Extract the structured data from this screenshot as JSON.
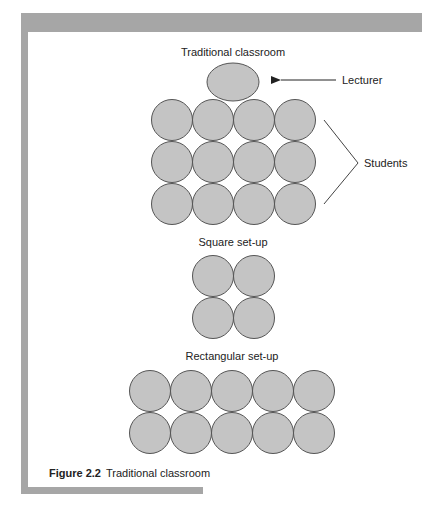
{
  "figure": {
    "caption_number": "Figure 2.2",
    "caption_text": "Traditional classroom",
    "colors": {
      "frame": "#a6a6a6",
      "circle_fill": "#c4c4c4",
      "circle_stroke": "#555555"
    }
  },
  "sections": [
    {
      "title": "Traditional classroom",
      "layout": "lecturer ellipse above 3 rows x 4 columns of students"
    },
    {
      "title": "Square set-up",
      "layout": "2 rows x 2 columns"
    },
    {
      "title": "Rectangular set-up",
      "layout": "2 rows x 5 columns"
    }
  ],
  "annotations": {
    "lecturer": "Lecturer",
    "students": "Students"
  }
}
